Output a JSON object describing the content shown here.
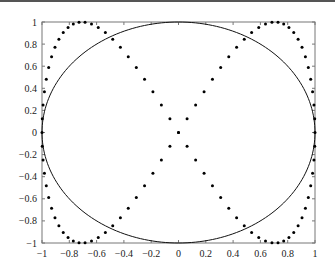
{
  "chart_data": {
    "type": "scatter",
    "title": "",
    "xlabel": "",
    "ylabel": "",
    "xlim": [
      -1,
      1
    ],
    "ylim": [
      -1,
      1
    ],
    "grid": false,
    "legend": null,
    "x_ticks": [
      "-1",
      "-0.8",
      "-0.6",
      "-0.4",
      "-0.2",
      "0",
      "0.2",
      "0.4",
      "0.6",
      "0.8",
      "1"
    ],
    "y_ticks": [
      "-1",
      "-0.8",
      "-0.6",
      "-0.4",
      "-0.2",
      "0",
      "0.2",
      "0.4",
      "0.6",
      "0.8",
      "1"
    ],
    "series": [
      {
        "name": "circle",
        "style": "solid line",
        "color": "#000000",
        "equation": "x = cos(t), y = sin(t), t in [0, 2π]"
      },
      {
        "name": "dotted-curve",
        "style": "dots",
        "color": "#000000",
        "equation": "x = sin(t), y = sin(2t), t in [0, 2π]",
        "num_points": 100
      }
    ]
  },
  "plot": {
    "left": 42,
    "top": 22,
    "right": 315,
    "bottom": 243
  }
}
